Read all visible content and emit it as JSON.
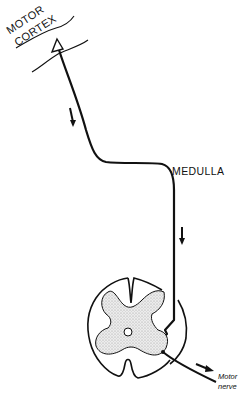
{
  "diagram": {
    "labels": {
      "cortex_line1": "MOTOR",
      "cortex_line2": "CORTEX",
      "medulla": "MEDULLA",
      "motor_nerve_line1": "Motor",
      "motor_nerve_line2": "nerve"
    },
    "colors": {
      "line": "#111111",
      "gray_matter": "#d9d9d9",
      "background": "#ffffff"
    }
  }
}
